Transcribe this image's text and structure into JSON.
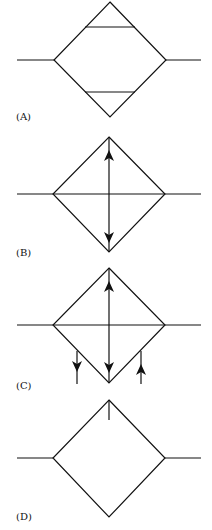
{
  "figure": {
    "panels": [
      {
        "id": "A",
        "label": "(A)",
        "description": "Diamond with horizontal leads and two internal horizontal chords near top and bottom vertices"
      },
      {
        "id": "B",
        "label": "(B)",
        "description": "Diamond with horizontal line through left/right vertices and vertical line with up and down arrows"
      },
      {
        "id": "C",
        "label": "(C)",
        "description": "Diamond as in B plus two short vertical lines below lower edges with down arrow (left) and up arrow (right)"
      },
      {
        "id": "D",
        "label": "(D)",
        "description": "Diamond with horizontal leads and short vertical stub descending from top vertex"
      }
    ]
  }
}
